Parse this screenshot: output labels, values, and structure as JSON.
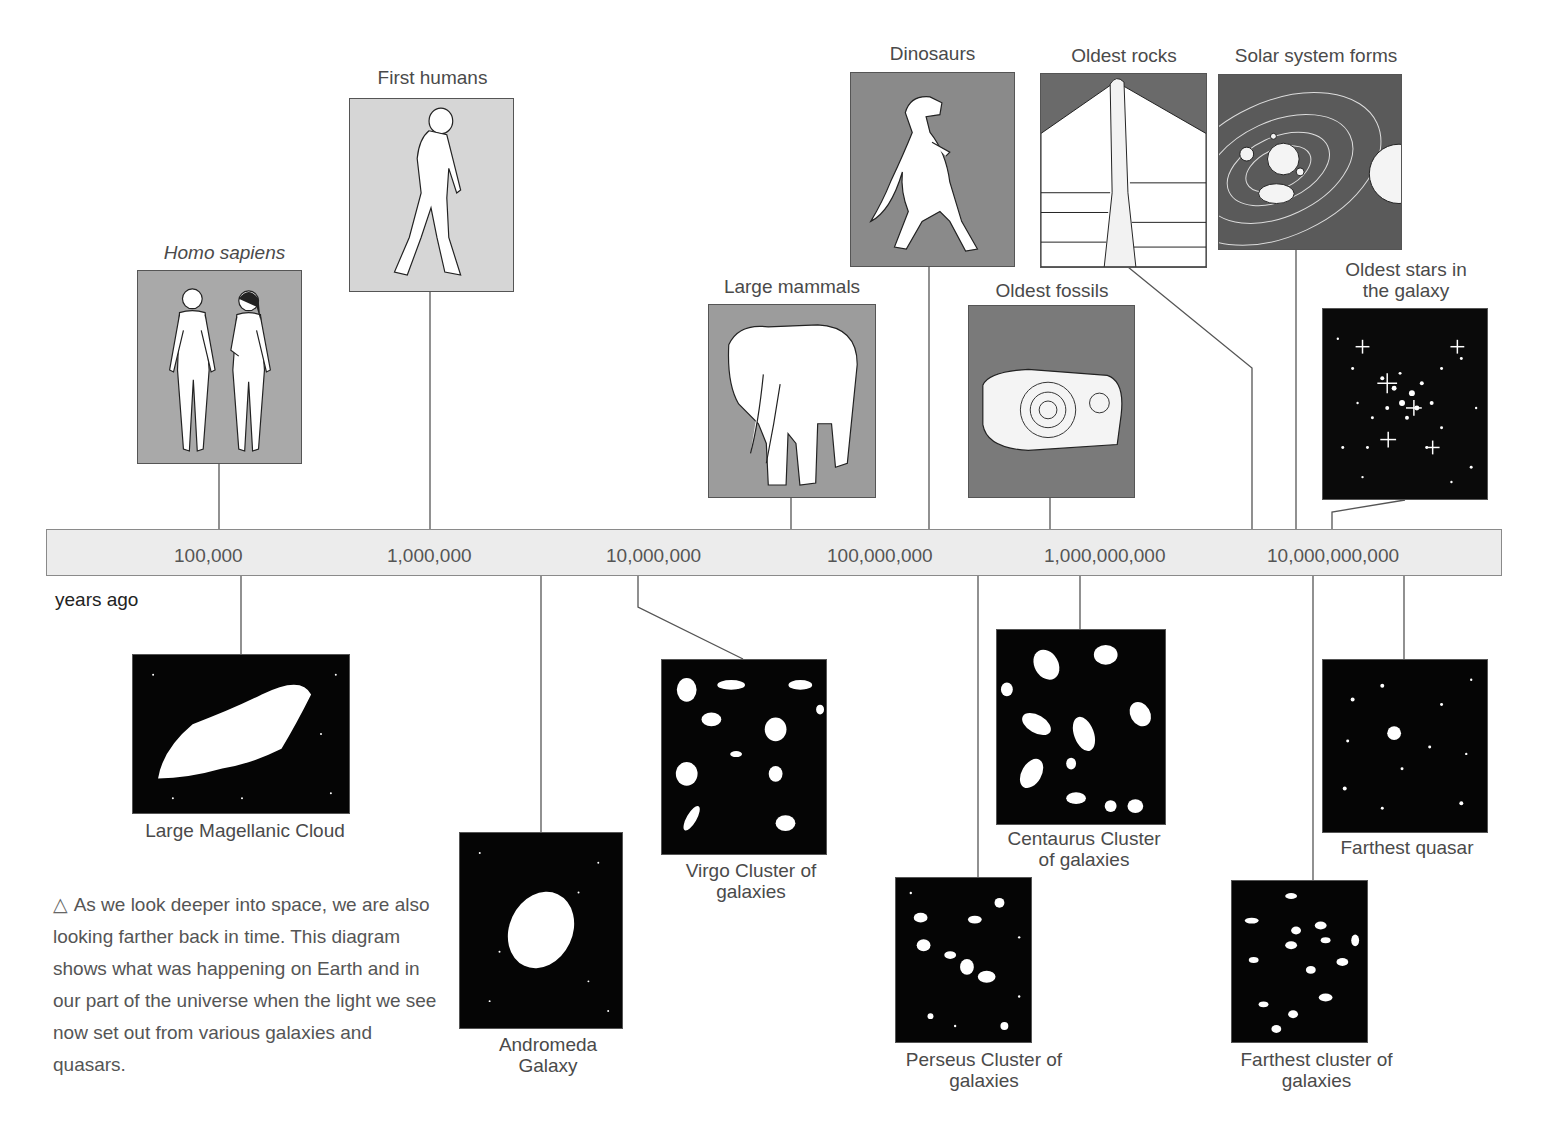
{
  "timeline": {
    "unit_label": "years ago",
    "ticks": [
      "100,000",
      "1,000,000",
      "10,000,000",
      "100,000,000",
      "1,000,000,000",
      "10,000,000,000"
    ],
    "bar_color": "#ececec"
  },
  "earth_events": [
    {
      "label": "Homo sapiens",
      "italic": true,
      "panel_color": "#a9a9a9"
    },
    {
      "label": "First humans",
      "panel_color": "#d6d6d6"
    },
    {
      "label": "Large mammals",
      "panel_color": "#9c9c9c"
    },
    {
      "label": "Dinosaurs",
      "panel_color": "#8a8a8a"
    },
    {
      "label": "Oldest fossils",
      "panel_color": "#7a7a7a"
    },
    {
      "label": "Oldest rocks",
      "panel_color": "#6a6a6a"
    },
    {
      "label": "Solar system forms",
      "panel_color": "#5a5a5a"
    },
    {
      "label": "Oldest stars in",
      "label2": "the galaxy",
      "panel_color": "#0a0a0a"
    }
  ],
  "space_objects": [
    {
      "label": "Large Magellanic Cloud"
    },
    {
      "label": "Andromeda",
      "label2": "Galaxy"
    },
    {
      "label": "Virgo Cluster of",
      "label2": "galaxies"
    },
    {
      "label": "Perseus Cluster of",
      "label2": "galaxies"
    },
    {
      "label": "Centaurus Cluster",
      "label2": "of galaxies"
    },
    {
      "label": "Farthest cluster of",
      "label2": "galaxies"
    },
    {
      "label": "Farthest quasar"
    }
  ],
  "caption": {
    "icon": "△",
    "text": "As we look deeper into space, we are also looking farther back in time. This diagram shows what was happening on Earth and in our part of the universe when the light we see now set out from various galaxies and quasars."
  }
}
